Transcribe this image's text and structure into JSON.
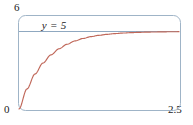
{
  "figure": {
    "background_color": "#ffffff",
    "frame": {
      "name": "plot-frame",
      "stroke_color": "#9fb4c7",
      "corner_radius": 7,
      "x": 18,
      "y": 15,
      "width": 162,
      "height": 95
    }
  },
  "labels": {
    "y_max": "6",
    "origin": "0",
    "x_max": "2.5",
    "asymptote": "y = 5"
  },
  "colors": {
    "curve": "#c0685a",
    "asymptote_line": "#8fa8c0",
    "frame": "#9fb4c7",
    "text": "#1a1a1a"
  },
  "chart_data": {
    "type": "line",
    "title": "",
    "xlabel": "",
    "ylabel": "",
    "xlim": [
      0,
      2.5
    ],
    "ylim": [
      0,
      6
    ],
    "grid": false,
    "legend": null,
    "xticks": [
      0,
      2.5
    ],
    "xticklabels": [
      "0",
      "2.5"
    ],
    "yticks": [
      0,
      6
    ],
    "yticklabels": [
      "0",
      "6"
    ],
    "annotations": [
      {
        "text": "y = 5",
        "x": 0.45,
        "y": 5.45,
        "style": "italic"
      }
    ],
    "series": [
      {
        "name": "asymptote",
        "type": "line",
        "color": "#8fa8c0",
        "equation": "y = 5",
        "x": [
          0,
          2.5
        ],
        "values": [
          5,
          5
        ]
      },
      {
        "name": "solution-curve",
        "type": "line",
        "color": "#c0685a",
        "equation": "y = 5(1 - e^(-2.4x))",
        "x": [
          0,
          0.125,
          0.25,
          0.375,
          0.5,
          0.625,
          0.75,
          0.875,
          1,
          1.125,
          1.25,
          1.375,
          1.5,
          1.625,
          1.75,
          1.875,
          2,
          2.125,
          2.25,
          2.375,
          2.5
        ],
        "values": [
          0,
          1.295,
          2.255,
          2.967,
          3.495,
          3.886,
          4.176,
          4.391,
          4.55,
          4.668,
          4.754,
          4.818,
          4.865,
          4.9,
          4.926,
          4.945,
          4.959,
          4.97,
          4.978,
          4.984,
          4.988
        ]
      }
    ]
  }
}
